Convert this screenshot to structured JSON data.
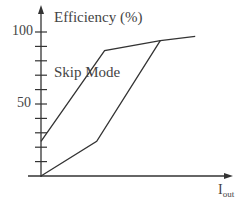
{
  "chart_data": {
    "type": "line",
    "title": "Efficiency (%)",
    "xlabel": "Iout",
    "ylabel": "Efficiency (%)",
    "ylim": [
      0,
      100
    ],
    "xlim": [
      0,
      100
    ],
    "yticks": [
      0,
      10,
      20,
      30,
      40,
      50,
      60,
      70,
      80,
      90,
      100
    ],
    "ytick_labels": [
      "50",
      "100"
    ],
    "xticks": [],
    "grid": false,
    "legend": null,
    "annotations": [
      "Skip Mode"
    ],
    "series": [
      {
        "name": "Skip Mode",
        "x": [
          0,
          40,
          75,
          97
        ],
        "y": [
          24,
          87,
          94,
          97
        ]
      },
      {
        "name": "Without Skip Mode",
        "x": [
          0,
          35,
          75
        ],
        "y": [
          0,
          24,
          94
        ]
      }
    ]
  },
  "labels": {
    "title": "Efficiency (%)",
    "annotation": "Skip Mode",
    "tick_100": "100",
    "tick_50": "50",
    "x_main": "I",
    "x_sub": "out"
  },
  "colors": {
    "line": "#333333",
    "axis": "#333333",
    "text": "#444444"
  }
}
